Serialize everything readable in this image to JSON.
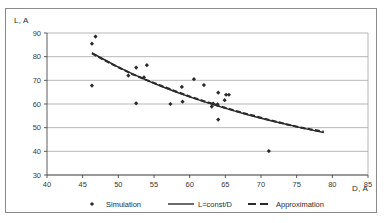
{
  "chart_data": {
    "type": "scatter",
    "title": "",
    "xlabel": "D, A",
    "ylabel": "L, A",
    "xlim": [
      40,
      85
    ],
    "ylim": [
      30,
      90
    ],
    "xticks": [
      40,
      45,
      50,
      55,
      60,
      65,
      70,
      75,
      80,
      85
    ],
    "yticks": [
      30,
      40,
      50,
      60,
      70,
      80,
      90
    ],
    "grid": "horizontal",
    "legend_position": "bottom",
    "series": [
      {
        "name": "Simulation",
        "type": "scatter",
        "marker": "diamond",
        "color": "#2a2a2a",
        "points": [
          [
            46.3,
            85.5
          ],
          [
            46.8,
            88.5
          ],
          [
            46.3,
            67.8
          ],
          [
            51.4,
            72.0
          ],
          [
            52.5,
            75.4
          ],
          [
            52.5,
            60.3
          ],
          [
            53.6,
            71.3
          ],
          [
            54.0,
            76.4
          ],
          [
            57.3,
            60.0
          ],
          [
            58.9,
            67.2
          ],
          [
            59.0,
            61.0
          ],
          [
            60.6,
            70.5
          ],
          [
            62.0,
            68.0
          ],
          [
            63.1,
            58.9
          ],
          [
            63.3,
            60.2
          ],
          [
            63.9,
            59.9
          ],
          [
            64.0,
            64.8
          ],
          [
            64.0,
            53.4
          ],
          [
            64.9,
            61.6
          ],
          [
            65.1,
            63.9
          ],
          [
            65.5,
            63.9
          ],
          [
            71.1,
            40.1
          ]
        ]
      },
      {
        "name": "L=const/D",
        "type": "line",
        "style": "solid",
        "color": "#2a2a2a",
        "const": 3780,
        "x_range": [
          46.3,
          78.8
        ],
        "points": [
          [
            46.3,
            81.6
          ],
          [
            48.0,
            78.8
          ],
          [
            50.0,
            75.6
          ],
          [
            52.0,
            72.7
          ],
          [
            54.0,
            70.0
          ],
          [
            56.0,
            67.5
          ],
          [
            58.0,
            65.2
          ],
          [
            60.0,
            63.0
          ],
          [
            62.0,
            61.0
          ],
          [
            64.0,
            59.1
          ],
          [
            66.0,
            57.3
          ],
          [
            68.0,
            55.6
          ],
          [
            70.0,
            54.0
          ],
          [
            72.0,
            52.5
          ],
          [
            74.0,
            51.1
          ],
          [
            76.0,
            49.7
          ],
          [
            78.8,
            48.0
          ]
        ]
      },
      {
        "name": "Approximation",
        "type": "line",
        "style": "dashed",
        "color": "#2a2a2a",
        "x_range": [
          46.3,
          78.8
        ],
        "points": [
          [
            46.3,
            81.4
          ],
          [
            48.0,
            78.6
          ],
          [
            50.0,
            75.5
          ],
          [
            52.0,
            72.6
          ],
          [
            54.0,
            70.1
          ],
          [
            56.0,
            67.7
          ],
          [
            58.0,
            65.4
          ],
          [
            60.0,
            63.2
          ],
          [
            62.0,
            61.2
          ],
          [
            64.0,
            59.3
          ],
          [
            66.0,
            57.5
          ],
          [
            68.0,
            55.8
          ],
          [
            70.0,
            54.2
          ],
          [
            72.0,
            52.6
          ],
          [
            74.0,
            51.1
          ],
          [
            76.0,
            49.8
          ],
          [
            78.8,
            48.3
          ]
        ]
      }
    ]
  },
  "legend": {
    "items": [
      {
        "label": "Simulation",
        "marker": "diamond"
      },
      {
        "label": "L=const/D",
        "marker": "solid-line"
      },
      {
        "label": "Approximation",
        "marker": "dashed-line"
      }
    ]
  },
  "axes": {
    "y_title": "L, A",
    "x_title": "D, A",
    "y_tick_labels": [
      "90",
      "80",
      "70",
      "60",
      "50",
      "40",
      "30"
    ],
    "x_tick_labels": [
      "40",
      "45",
      "50",
      "55",
      "60",
      "65",
      "70",
      "75",
      "80",
      "85"
    ]
  },
  "colors": {
    "frame": "#8a8a8a",
    "grid": "#9a9a9a",
    "axis": "#4a4a4a",
    "data": "#2a2a2a",
    "background": "#ffffff"
  }
}
